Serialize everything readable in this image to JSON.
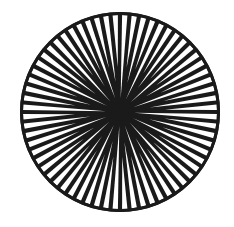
{
  "image": {
    "subject": "radial septa drawing (mushroom coral)",
    "background": "#ffffff",
    "ink": "#1a1a1a",
    "center": [
      120,
      112
    ],
    "radius": 100,
    "rays": 64
  }
}
